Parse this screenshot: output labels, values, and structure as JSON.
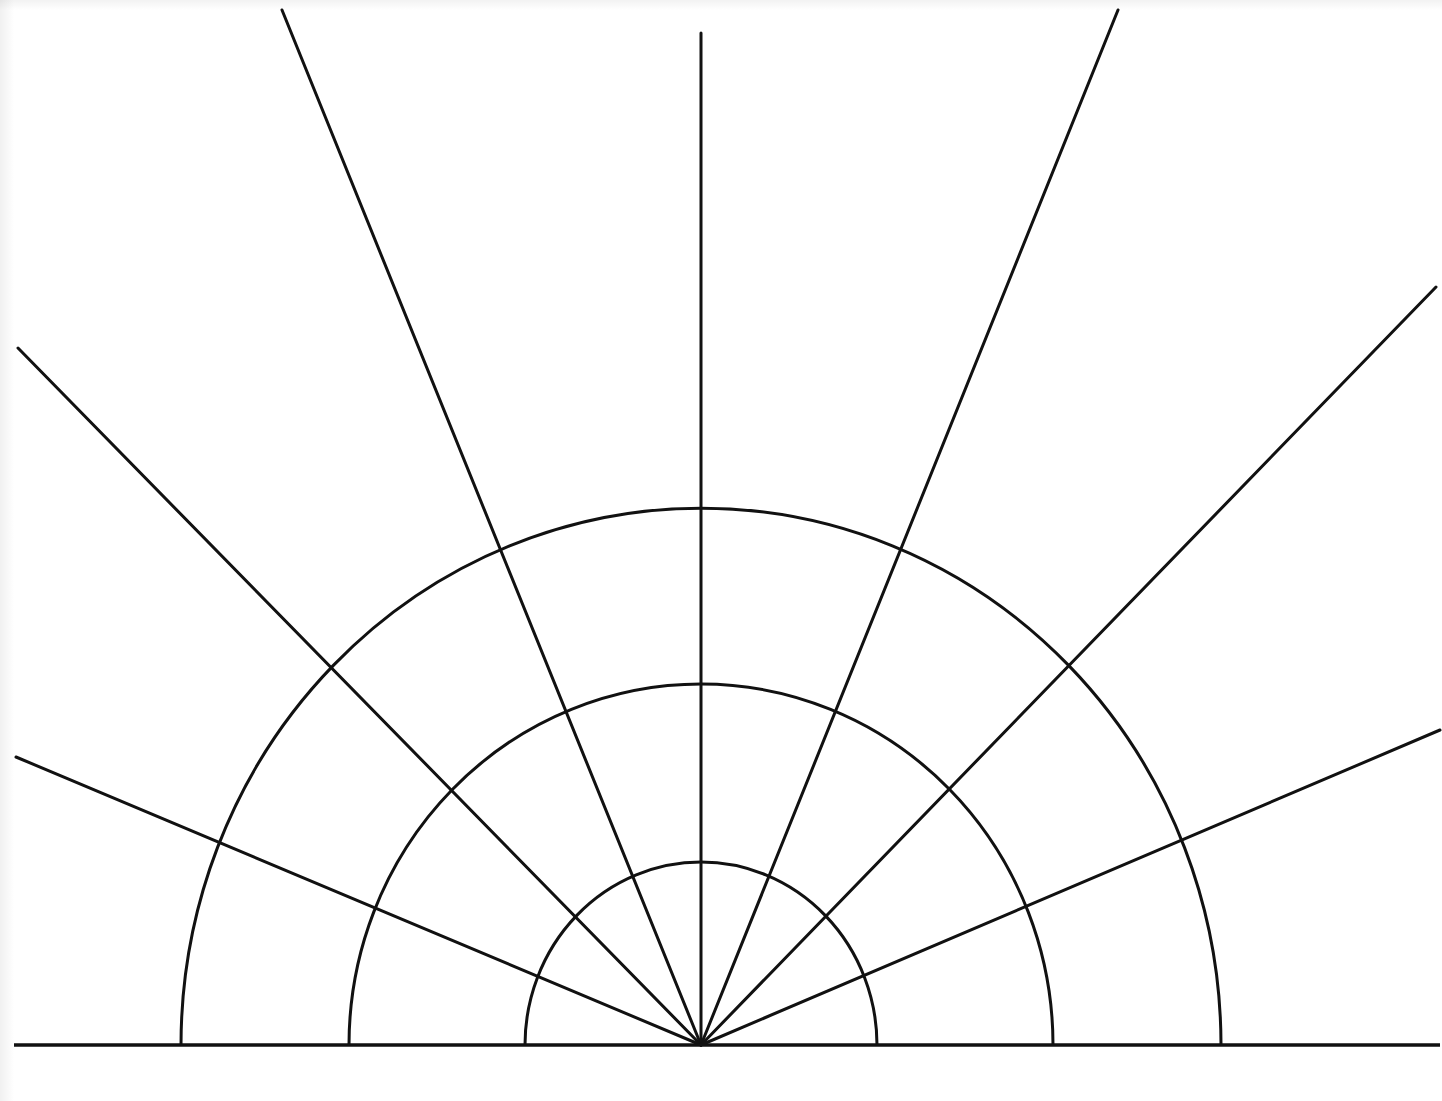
{
  "diagram": {
    "type": "polar-grid-half",
    "stroke_color": "#111111",
    "background_color": "#ffffff",
    "stroke_width": 3,
    "center": {
      "x": 701,
      "y": 1045
    },
    "baseline": {
      "x1": 14,
      "y1": 1045,
      "x2": 1440,
      "y2": 1045
    },
    "arcs": [
      {
        "name": "inner",
        "rx": 176,
        "ry": 183
      },
      {
        "name": "middle",
        "rx": 352,
        "ry": 361
      },
      {
        "name": "outer",
        "rx": 520,
        "ry": 537
      }
    ],
    "rays": [
      {
        "name": "left-low",
        "x2": 16,
        "y2": 757
      },
      {
        "name": "left-mid",
        "x2": 18,
        "y2": 348
      },
      {
        "name": "left-high",
        "x2": 282,
        "y2": 10
      },
      {
        "name": "vertical",
        "x2": 701,
        "y2": 33
      },
      {
        "name": "right-high",
        "x2": 1118,
        "y2": 10
      },
      {
        "name": "right-mid",
        "x2": 1436,
        "y2": 287
      },
      {
        "name": "right-low",
        "x2": 1440,
        "y2": 730
      }
    ]
  }
}
